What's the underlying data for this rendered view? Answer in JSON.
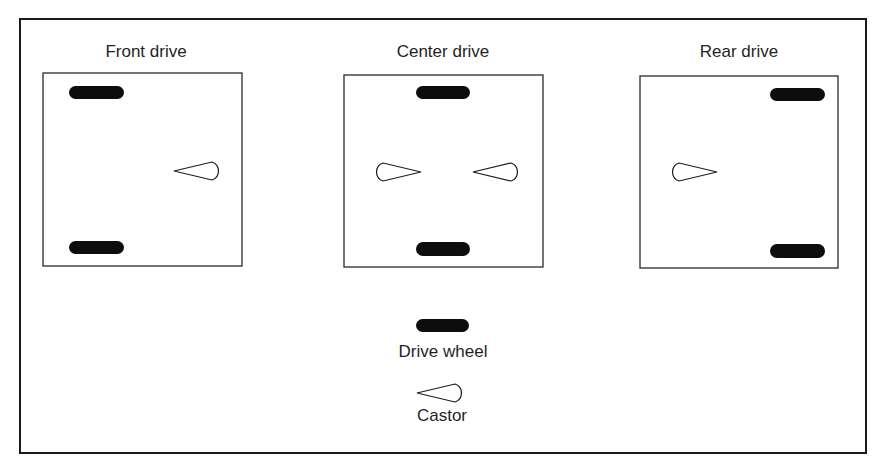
{
  "diagram": {
    "configurations": [
      {
        "title": "Front drive",
        "drive_wheels": "left (front)",
        "castors": [
          "right, pointing left"
        ]
      },
      {
        "title": "Center drive",
        "drive_wheels": "center",
        "castors": [
          "left, pointing right",
          "right, pointing left"
        ]
      },
      {
        "title": "Rear drive",
        "drive_wheels": "right (rear)",
        "castors": [
          "left, pointing right"
        ]
      }
    ],
    "legend": {
      "drive_wheel_label": "Drive wheel",
      "castor_label": "Castor"
    },
    "colors": {
      "wheel": "#0d0d0d",
      "outline": "#1a1a1a",
      "background": "#ffffff"
    }
  }
}
